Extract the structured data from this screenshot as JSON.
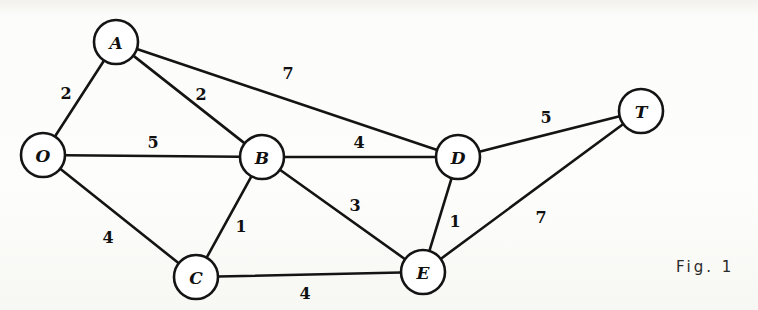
{
  "figure": {
    "caption": "Fig. 1",
    "caption_x": 676,
    "caption_y": 258
  },
  "chart_data": {
    "type": "diagram",
    "subtype": "weighted-undirected-graph",
    "title": "Fig. 1",
    "width": 758,
    "height": 310,
    "node_radius": 22,
    "nodes": [
      {
        "id": "O",
        "label": "O",
        "x": 43,
        "y": 155
      },
      {
        "id": "A",
        "label": "A",
        "x": 116,
        "y": 42
      },
      {
        "id": "B",
        "label": "B",
        "x": 262,
        "y": 157
      },
      {
        "id": "C",
        "label": "C",
        "x": 196,
        "y": 277
      },
      {
        "id": "D",
        "label": "D",
        "x": 458,
        "y": 157
      },
      {
        "id": "E",
        "label": "E",
        "x": 423,
        "y": 272
      },
      {
        "id": "T",
        "label": "T",
        "x": 641,
        "y": 111
      }
    ],
    "edges": [
      {
        "from": "O",
        "to": "A",
        "weight": 2,
        "label": "2",
        "lx": 66,
        "ly": 93
      },
      {
        "from": "O",
        "to": "B",
        "weight": 5,
        "label": "5",
        "lx": 153,
        "ly": 142
      },
      {
        "from": "O",
        "to": "C",
        "weight": 4,
        "label": "4",
        "lx": 108,
        "ly": 237
      },
      {
        "from": "A",
        "to": "B",
        "weight": 2,
        "label": "2",
        "lx": 201,
        "ly": 94
      },
      {
        "from": "A",
        "to": "D",
        "weight": 7,
        "label": "7",
        "lx": 288,
        "ly": 73
      },
      {
        "from": "B",
        "to": "C",
        "weight": 1,
        "label": "1",
        "lx": 241,
        "ly": 226
      },
      {
        "from": "B",
        "to": "D",
        "weight": 4,
        "label": "4",
        "lx": 359,
        "ly": 142
      },
      {
        "from": "B",
        "to": "E",
        "weight": 3,
        "label": "3",
        "lx": 355,
        "ly": 205
      },
      {
        "from": "C",
        "to": "E",
        "weight": 4,
        "label": "4",
        "lx": 305,
        "ly": 293
      },
      {
        "from": "D",
        "to": "E",
        "weight": 1,
        "label": "1",
        "lx": 455,
        "ly": 221
      },
      {
        "from": "D",
        "to": "T",
        "weight": 5,
        "label": "5",
        "lx": 546,
        "ly": 117
      },
      {
        "from": "E",
        "to": "T",
        "weight": 7,
        "label": "7",
        "lx": 541,
        "ly": 217
      }
    ]
  },
  "colors": {
    "ink": "#141414",
    "paper": "#fbfbf9",
    "node_fill": "#ffffff"
  }
}
